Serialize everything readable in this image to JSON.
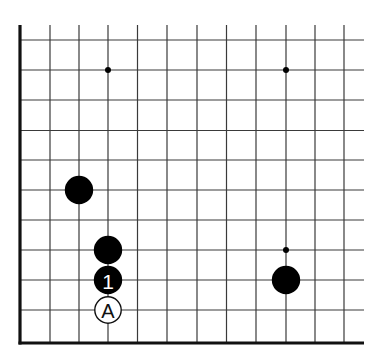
{
  "diagram": {
    "type": "go-board-fragment",
    "colors": {
      "background": "#ffffff",
      "grid_line": "#3a3a3a",
      "edge_line": "#111111",
      "black_stone": "#000000",
      "white_stone": "#ffffff",
      "white_stone_outline": "#111111",
      "label_on_black": "#ffffff",
      "label_on_white": "#111111"
    },
    "grid": {
      "columns_x": [
        20,
        50,
        79,
        108,
        137.5,
        167,
        197,
        226.5,
        256,
        286,
        315,
        344
      ],
      "rows_y": [
        40,
        70,
        100,
        130.5,
        160,
        190,
        220,
        250,
        280,
        310
      ],
      "top_open_y": 25,
      "right_open_x": 364,
      "left_edge_x": 20,
      "bottom_edge_y": 343,
      "edges": [
        "left",
        "bottom"
      ]
    },
    "star_points": [
      {
        "col": 3,
        "row": 1
      },
      {
        "col": 9,
        "row": 1
      },
      {
        "col": 9,
        "row": 7
      }
    ],
    "stones": [
      {
        "color": "black",
        "col": 2,
        "row": 5,
        "label": ""
      },
      {
        "color": "black",
        "col": 3,
        "row": 7,
        "label": ""
      },
      {
        "color": "black",
        "col": 3,
        "row": 8,
        "label": "1"
      },
      {
        "color": "black",
        "col": 9,
        "row": 8,
        "label": ""
      }
    ],
    "markers": [
      {
        "type": "letter-circle",
        "col": 3,
        "row": 9,
        "label": "A"
      }
    ]
  }
}
